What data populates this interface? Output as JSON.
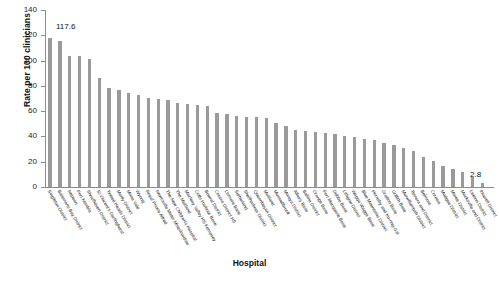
{
  "chart_data": {
    "type": "bar",
    "title": "",
    "xlabel": "Hospital",
    "ylabel": "Rate per 100 clinicians",
    "ylim": [
      0,
      140
    ],
    "ytick_labels": [
      "0",
      "20",
      "40",
      "60",
      "80",
      "100",
      "120",
      "140"
    ],
    "ytick_values": [
      0,
      20,
      40,
      60,
      80,
      100,
      120,
      140
    ],
    "grid": false,
    "legend": null,
    "bar_color": "#9a9a9a",
    "annotations": [
      {
        "name": "max-value",
        "text": "117.6",
        "value": 117.6,
        "category": "Singleton District"
      },
      {
        "name": "min-value",
        "text": "2.8",
        "value": 2.8,
        "category": "Inverell District"
      }
    ],
    "categories": [
      "Singleton District",
      "Batemans Bay District",
      "Nepean",
      "Port Kembla",
      "Shoalhaven District",
      "St Vincent's Darlinghurst",
      "Tweed Heads District",
      "Manly District",
      "Mona Vale",
      "Wyong",
      "Royal Prince Alfred",
      "Newcastle Mater Misericordiae",
      "The New Children's Hospital",
      "The Maitland",
      "Macleay Valley HS Kempsey",
      "Coffs Harbour Base",
      "Bowral District",
      "Cooma District HS",
      "Lismore Base",
      "Sutherland",
      "Shellharbour District",
      "Queanbeyan District",
      "Maitland",
      "Muswellbrook",
      "Moruya District",
      "Albury Base",
      "Ballina District",
      "Orange Base",
      "Port Macquarie Base",
      "Dubbo Base",
      "Lithgow District",
      "Wagga Wagga Base",
      "Blue Mountains District",
      "Hornsby and Ku-ring-Gai",
      "Grafton Base",
      "Griffith Base",
      "Murwillumbah District",
      "Temora and District",
      "Belmont",
      "Corowa",
      "Mudgee District",
      "Moree District",
      "Macksville and District",
      "Leeton District",
      "Inverell District"
    ],
    "values": [
      117.6,
      115.2,
      104.0,
      103.6,
      101.6,
      86.0,
      78.4,
      76.8,
      74.4,
      72.6,
      70.8,
      69.6,
      69.0,
      66.4,
      65.6,
      65.0,
      64.0,
      58.8,
      57.6,
      56.4,
      55.6,
      55.2,
      54.4,
      50.4,
      48.4,
      45.2,
      44.4,
      43.6,
      42.8,
      41.6,
      40.4,
      39.2,
      38.0,
      36.8,
      35.2,
      33.6,
      31.2,
      28.4,
      24.0,
      20.4,
      16.8,
      14.0,
      11.6,
      8.0,
      2.8
    ]
  }
}
